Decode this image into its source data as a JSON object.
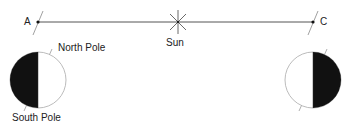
{
  "diagram": {
    "points": {
      "a": "A",
      "c": "C"
    },
    "sun_label": "Sun",
    "earth_left": {
      "north_label": "North Pole",
      "south_label": "South Pole"
    },
    "colors": {
      "line": "#333333",
      "dark": "#111111",
      "outline": "#aaaaaa"
    }
  }
}
